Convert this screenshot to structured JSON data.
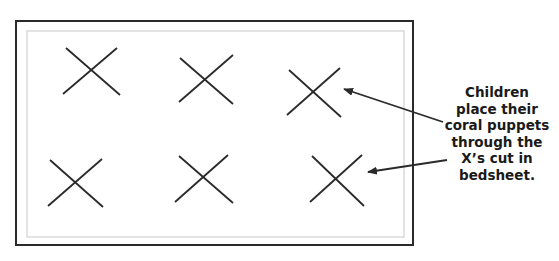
{
  "diagram": {
    "colors": {
      "line": "#2a2a2a",
      "inner_border": "#d0d0d0",
      "background": "#ffffff"
    },
    "outer_rect": {
      "x": 16,
      "y": 21,
      "w": 397,
      "h": 224
    },
    "inner_rect": {
      "x": 27,
      "y": 31,
      "w": 377,
      "h": 206
    },
    "x_marks": [
      {
        "id": "x1",
        "cx": 92,
        "cy": 71
      },
      {
        "id": "x2",
        "cx": 206,
        "cy": 80
      },
      {
        "id": "x3",
        "cx": 314,
        "cy": 92
      },
      {
        "id": "x4",
        "cx": 76,
        "cy": 183
      },
      {
        "id": "x5",
        "cx": 203,
        "cy": 179
      },
      {
        "id": "x6",
        "cx": 337,
        "cy": 180
      }
    ],
    "arrows": [
      {
        "from": [
          443,
          122
        ],
        "to": [
          343,
          89
        ],
        "target": "x3"
      },
      {
        "from": [
          447,
          160
        ],
        "to": [
          367,
          172
        ],
        "target": "x6"
      }
    ],
    "annotation": {
      "lines": [
        "Children",
        "place their",
        "coral puppets",
        "through the",
        "X’s cut in",
        "bedsheet."
      ]
    }
  }
}
